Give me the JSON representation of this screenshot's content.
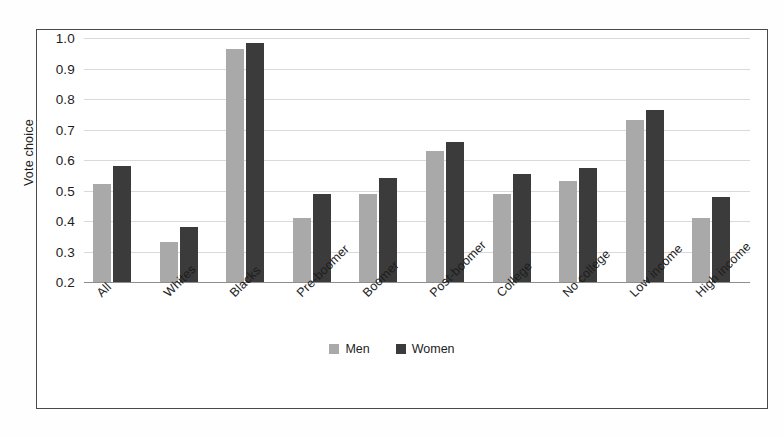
{
  "chart_data": {
    "type": "bar",
    "title": "",
    "xlabel": "",
    "ylabel": "Vote choice",
    "ylim": [
      0.2,
      1.0
    ],
    "ytick_labels": [
      "1.0",
      "0.9",
      "0.8",
      "0.7",
      "0.6",
      "0.5",
      "0.4",
      "0.3",
      "0.2"
    ],
    "ytick_values": [
      1.0,
      0.9,
      0.8,
      0.7,
      0.6,
      0.5,
      0.4,
      0.3,
      0.2
    ],
    "grid": true,
    "legend_position": "bottom-center",
    "categories": [
      "All",
      "Whites",
      "Blacks",
      "Pre-boomer",
      "Boomer",
      "Post-boomer",
      "College",
      "No college",
      "Low income",
      "High income"
    ],
    "series": [
      {
        "name": "Men",
        "color": "#a9a9a9",
        "values": [
          0.52,
          0.33,
          0.965,
          0.41,
          0.49,
          0.63,
          0.49,
          0.53,
          0.73,
          0.41
        ]
      },
      {
        "name": "Women",
        "color": "#3b3b3b",
        "values": [
          0.58,
          0.38,
          0.985,
          0.49,
          0.54,
          0.66,
          0.555,
          0.575,
          0.765,
          0.48
        ]
      }
    ]
  },
  "legend": {
    "items": [
      {
        "label": "Men",
        "color": "#a9a9a9"
      },
      {
        "label": "Women",
        "color": "#3b3b3b"
      }
    ]
  }
}
